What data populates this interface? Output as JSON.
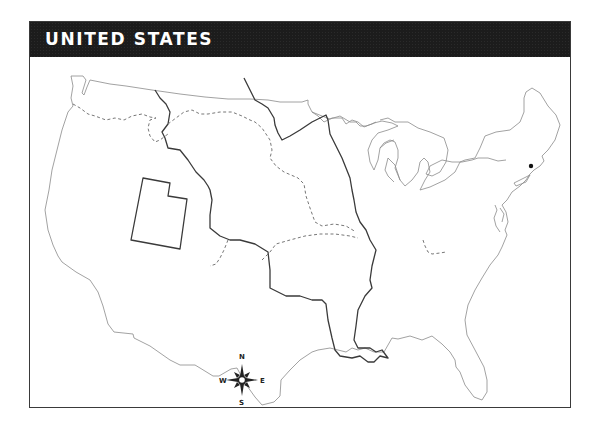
{
  "map": {
    "title": "UNITED STATES",
    "compass": {
      "north": "N",
      "south": "S",
      "east": "E",
      "west": "W"
    },
    "colors": {
      "title_bar": "#1c1c1c",
      "title_text": "#ffffff",
      "frame_border": "#3a3a3a",
      "coastline": "#8a8a8a",
      "territory_border": "#3a3a3a",
      "marker": "#111111"
    },
    "features": {
      "marker": {
        "label": "",
        "x": 531,
        "y": 166
      },
      "outlined_region": "Utah (territory outline)",
      "solid_borders": "Louisiana Purchase / territorial boundaries",
      "dashed_borders": "trail routes"
    }
  }
}
